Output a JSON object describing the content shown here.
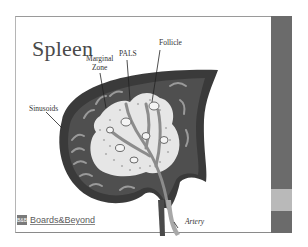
{
  "slide": {
    "title": "Spleen",
    "labels": {
      "marginal_zone_line1": "Marginal",
      "marginal_zone_line2": "Zone",
      "pals": "PALS",
      "follicle": "Follicle",
      "sinusoids": "Sinusoids",
      "artery": "Artery"
    },
    "logo": {
      "mark": "B&B",
      "text": "Boards&Beyond"
    }
  },
  "colors": {
    "capsule": "#3a3a3a",
    "red_pulp": "#5a5a5a",
    "white_pulp": "#e8e8e8",
    "vessel": "#a0a0a0",
    "side_bar": "#6b6b6b",
    "side_bar_accent": "#b9b9b9"
  }
}
